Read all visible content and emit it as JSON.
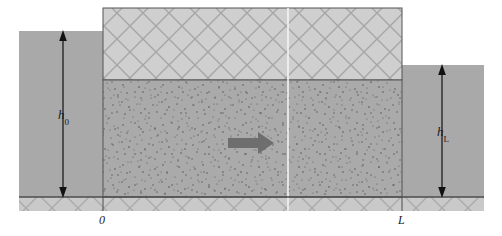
{
  "figure": {
    "title": "",
    "type": "schematic-cross-section",
    "labels": {
      "head_left_var": "h",
      "head_left_sub": "0",
      "head_right_var": "h",
      "head_right_sub": "L",
      "origin": "0",
      "length": "L"
    },
    "colors": {
      "reservoir_fill": "#a9a9a9",
      "saturated_fill": "#aaaaaa",
      "unsaturated_fill": "#cdcdcd",
      "bedrock_fill": "#c9c9c9",
      "hatch_stroke": "#9a9a9a",
      "outline": "#555555",
      "arrow_fill": "#6e6e6e",
      "dot_color": "#4a4a4a",
      "label_color": "#1a1a1a",
      "background": "#ffffff",
      "divider_line": "#f2f2f2"
    },
    "geometry": {
      "block_left_x": 103,
      "block_right_x": 402,
      "block_top_y": 8,
      "water_table_y": 80,
      "ground_y": 197,
      "bedrock_bottom_y": 211,
      "left_reservoir_top_y": 31,
      "left_reservoir_left_x": 19,
      "right_reservoir_top_y": 65,
      "right_reservoir_right_x": 484,
      "divider_x": 288,
      "flow_arrow_y": 143
    },
    "elements": {
      "left_reservoir_name": "left reservoir",
      "right_reservoir_name": "right reservoir",
      "unsaturated_zone_name": "unsaturated hatched zone",
      "saturated_zone_name": "saturated stippled zone",
      "bedrock_name": "bedrock hatched base",
      "flow_arrow_name": "groundwater flow direction"
    }
  }
}
